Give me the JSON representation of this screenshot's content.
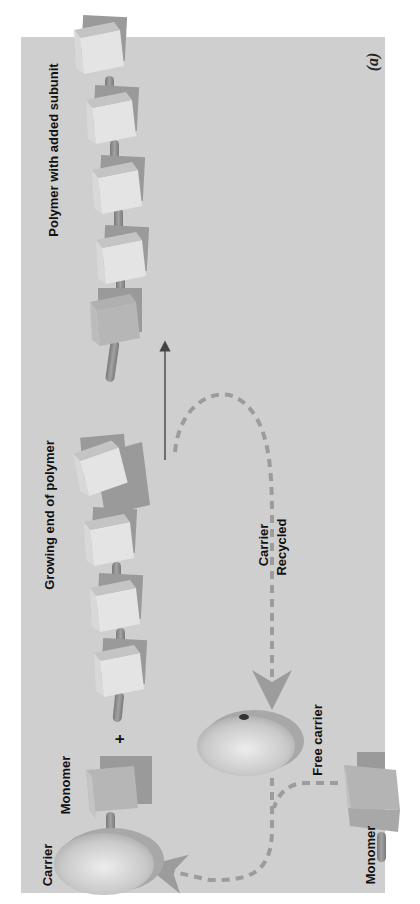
{
  "figure": {
    "panel_letter": "(a)",
    "orientation": "rotated 90° counter-clockwise (text reads bottom-to-top)",
    "colors": {
      "background": "#cfcfcf",
      "page": "#ffffff",
      "cube_front_light": "#e2e2e2",
      "cube_front_dark": "#b4b4b4",
      "cube_top": "#bdbdbd",
      "cube_shadow": "#9a9a9a",
      "link": "#8e8e8e",
      "carrier": "#c6c6c6",
      "dashed_path": "#9c9c9c",
      "arrow": "#444444",
      "text": "#111111"
    }
  },
  "labels": {
    "polymer_with_added_subunit": "Polymer with added subunit",
    "growing_end_of_polymer": "Growing end of polymer",
    "carrier_recycled_line1": "Carrier",
    "carrier_recycled_line2": "Recycled",
    "monomer_top": "Monomer",
    "carrier": "Carrier",
    "plus": "+",
    "free_carrier": "Free carrier",
    "monomer_free": "Monomer"
  },
  "diagram": {
    "nodes": [
      {
        "id": "polymer_product",
        "label": "Polymer with added subunit",
        "subunits": 5
      },
      {
        "id": "growing_polymer",
        "label": "Growing end of polymer",
        "subunits": 4
      },
      {
        "id": "carrier_monomer_complex",
        "label": "Carrier + Monomer"
      },
      {
        "id": "free_carrier",
        "label": "Free carrier"
      },
      {
        "id": "free_monomer",
        "label": "Monomer"
      }
    ],
    "edges": [
      {
        "from": "growing_polymer",
        "to": "polymer_product",
        "style": "solid arrow",
        "via": "+ carrier-bound monomer"
      },
      {
        "from": "growing_polymer",
        "to": "free_carrier",
        "style": "dashed arrow",
        "label": "Carrier Recycled"
      },
      {
        "from": "free_carrier",
        "to": "carrier_monomer_complex",
        "style": "dashed arrow",
        "joins": "free_monomer"
      }
    ]
  }
}
